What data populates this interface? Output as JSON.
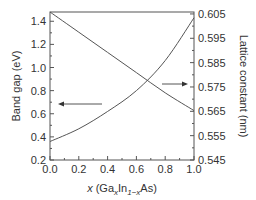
{
  "chart_data": {
    "type": "line",
    "title": "",
    "xlabel": "x (GaxIn1−xAs)",
    "xlabel_parts": {
      "var": "x",
      "open": " (Ga",
      "sub1": "x",
      "mid": "In",
      "sub2": "1−x",
      "close": "As)"
    },
    "ylabel_left": "Band gap (eV)",
    "ylabel_right": "Lattice constant (nm)",
    "xlim": [
      0.0,
      1.0
    ],
    "ylim_left": [
      0.2,
      1.48
    ],
    "ylim_right": [
      0.545,
      0.6058
    ],
    "x_ticks": [
      "0.0",
      "0.2",
      "0.4",
      "0.6",
      "0.8",
      "1.0"
    ],
    "y_ticks_left": [
      "0.2",
      "0.4",
      "0.6",
      "0.8",
      "1.0",
      "1.2",
      "1.4"
    ],
    "y_ticks_right": [
      "0.545",
      "0.555",
      "0.565",
      "0.575",
      "0.585",
      "0.595",
      "0.605"
    ],
    "series": [
      {
        "name": "Band gap",
        "axis": "left",
        "x": [
          0.0,
          0.2,
          0.4,
          0.6,
          0.8,
          1.0
        ],
        "values": [
          0.36,
          0.47,
          0.62,
          0.8,
          1.06,
          1.43
        ]
      },
      {
        "name": "Lattice constant",
        "axis": "right",
        "x": [
          0.0,
          0.2,
          0.4,
          0.6,
          0.8,
          1.0
        ],
        "values": [
          0.6058,
          0.5975,
          0.5892,
          0.5809,
          0.5726,
          0.5653
        ]
      }
    ],
    "annotations": [
      {
        "type": "arrow",
        "direction": "left",
        "points_to": "Band gap axis"
      },
      {
        "type": "arrow",
        "direction": "right",
        "points_to": "Lattice constant axis"
      }
    ],
    "grid": false,
    "legend": "none"
  }
}
